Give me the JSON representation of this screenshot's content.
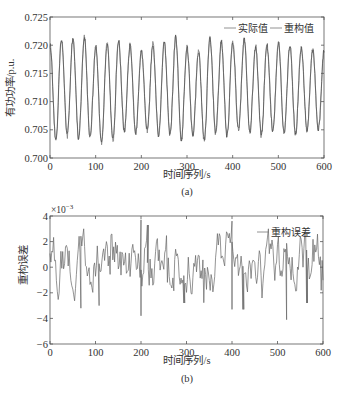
{
  "figure": {
    "panels": [
      {
        "id": "a",
        "caption": "(a)",
        "xlabel": "时间序列/s",
        "ylabel": "有功功率/p.u.",
        "y_exponent_label": "",
        "legend": [
          "实际值",
          "重构值"
        ]
      },
      {
        "id": "b",
        "caption": "(b)",
        "xlabel": "时间序列/s",
        "ylabel": "重构误差",
        "y_exponent_label": "×10",
        "y_exponent_power": "−3",
        "legend": [
          "重构误差"
        ]
      }
    ]
  },
  "chart_data": [
    {
      "type": "line",
      "title": "",
      "panel_caption": "(a)",
      "xlabel": "时间序列/s",
      "ylabel": "有功功率/p.u.",
      "xlim": [
        0,
        600
      ],
      "ylim": [
        0.7,
        0.725
      ],
      "xticks": [
        0,
        100,
        200,
        300,
        400,
        500,
        600
      ],
      "yticks": [
        0.7,
        0.705,
        0.71,
        0.715,
        0.72,
        0.725
      ],
      "ytick_labels": [
        "0.700",
        "0.705",
        "0.710",
        "0.715",
        "0.720",
        "0.725"
      ],
      "grid": false,
      "legend_position": "upper right",
      "series": [
        {
          "name": "实际值",
          "description": "quasi-sinusoidal oscillation, period ≈ 25 s, center ≈ 0.7125, amplitude ≈ 0.0075 with noise",
          "period_s": 25,
          "mean": 0.7125,
          "amplitude": 0.0075,
          "peaks_approx": [
            0.72,
            0.721,
            0.7212,
            0.7214,
            0.7198,
            0.7203,
            0.7206,
            0.72,
            0.719,
            0.7202,
            0.7205,
            0.7215,
            0.7195,
            0.719,
            0.7212,
            0.7205,
            0.7205,
            0.721,
            0.7198,
            0.72,
            0.7205,
            0.72,
            0.7195,
            0.719
          ],
          "troughs_approx": [
            0.703,
            0.704,
            0.7035,
            0.7038,
            0.7028,
            0.7032,
            0.7048,
            0.7045,
            0.705,
            0.704,
            0.7042,
            0.703,
            0.704,
            0.7032,
            0.7045,
            0.704,
            0.705,
            0.7045,
            0.704,
            0.7048,
            0.7045,
            0.7042,
            0.705,
            0.7052
          ]
        },
        {
          "name": "重构值",
          "description": "reconstruction closely overlapping the actual values",
          "period_s": 25,
          "mean": 0.7125,
          "amplitude": 0.0075
        }
      ]
    },
    {
      "type": "line",
      "title": "",
      "panel_caption": "(b)",
      "xlabel": "时间序列/s",
      "ylabel": "重构误差",
      "y_scale_factor": "×10^-3",
      "xlim": [
        0,
        600
      ],
      "ylim": [
        -6,
        4
      ],
      "xticks": [
        0,
        100,
        200,
        300,
        400,
        500,
        600
      ],
      "yticks": [
        -6,
        -4,
        -2,
        0,
        2,
        4
      ],
      "ytick_labels": [
        "−6",
        "−4",
        "−2",
        "0",
        "2",
        "4"
      ],
      "grid": false,
      "legend_position": "upper right",
      "series": [
        {
          "name": "重构误差",
          "description": "noise-like error centered near 0, range about −4 to +3.8 (×10^-3)",
          "notable_points": [
            {
              "x": 68,
              "y": -3.2
            },
            {
              "x": 108,
              "y": -3.0
            },
            {
              "x": 200,
              "y": 3.7
            },
            {
              "x": 200,
              "y": -3.8
            },
            {
              "x": 215,
              "y": 3.3
            },
            {
              "x": 295,
              "y": -2.8
            },
            {
              "x": 400,
              "y": 3.6
            },
            {
              "x": 400,
              "y": -3.3
            },
            {
              "x": 425,
              "y": -3.3
            },
            {
              "x": 520,
              "y": -4.1
            },
            {
              "x": 565,
              "y": -2.8
            }
          ],
          "min": -4.1,
          "max": 3.8,
          "mean": 0.0
        }
      ]
    }
  ]
}
